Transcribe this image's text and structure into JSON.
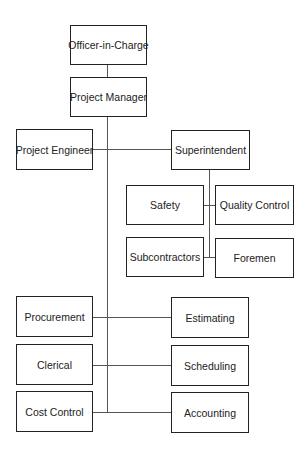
{
  "chart": {
    "type": "org-chart",
    "nodes": [
      {
        "id": "officer",
        "label": "Officer-in-Charge"
      },
      {
        "id": "pm",
        "label": "Project Manager"
      },
      {
        "id": "pe",
        "label": "Project Engineer"
      },
      {
        "id": "super",
        "label": "Superintendent"
      },
      {
        "id": "safety",
        "label": "Safety"
      },
      {
        "id": "qc",
        "label": "Quality Control"
      },
      {
        "id": "subs",
        "label": "Subcontractors"
      },
      {
        "id": "foremen",
        "label": "Foremen"
      },
      {
        "id": "procurement",
        "label": "Procurement"
      },
      {
        "id": "estimating",
        "label": "Estimating"
      },
      {
        "id": "clerical",
        "label": "Clerical"
      },
      {
        "id": "scheduling",
        "label": "Scheduling"
      },
      {
        "id": "cost",
        "label": "Cost Control"
      },
      {
        "id": "accounting",
        "label": "Accounting"
      }
    ]
  },
  "colors": {
    "border": "#222222",
    "line": "#555555",
    "background": "#ffffff"
  }
}
